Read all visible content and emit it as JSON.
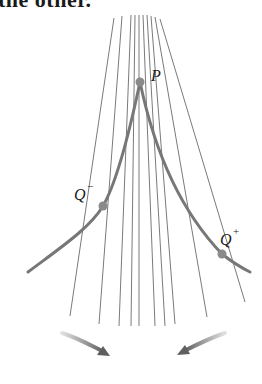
{
  "caption_fragment": "the other.",
  "points": {
    "P": {
      "label": "P",
      "x": 140,
      "y": 82
    },
    "Q_minus": {
      "label": "Q",
      "sup": "−",
      "x": 103,
      "y": 206
    },
    "Q_plus": {
      "label": "Q",
      "sup": "+",
      "x": 222,
      "y": 254
    }
  },
  "lines": [
    {
      "x1": 114,
      "y1": 18,
      "x2": 70,
      "y2": 316
    },
    {
      "x1": 122,
      "y1": 16,
      "x2": 99,
      "y2": 324
    },
    {
      "x1": 131,
      "y1": 15,
      "x2": 119,
      "y2": 326
    },
    {
      "x1": 135,
      "y1": 15,
      "x2": 131,
      "y2": 326
    },
    {
      "x1": 139,
      "y1": 15,
      "x2": 139,
      "y2": 326
    },
    {
      "x1": 143,
      "y1": 15,
      "x2": 155,
      "y2": 326
    },
    {
      "x1": 147,
      "y1": 15,
      "x2": 165,
      "y2": 326
    },
    {
      "x1": 151,
      "y1": 16,
      "x2": 175,
      "y2": 324
    },
    {
      "x1": 155,
      "y1": 17,
      "x2": 207,
      "y2": 317
    },
    {
      "x1": 160,
      "y1": 19,
      "x2": 245,
      "y2": 302
    }
  ],
  "colors": {
    "line": "#7a7a7a",
    "curve": "#777777",
    "dot": "#8a8a8a",
    "arrow_dark": "#6a6a6a",
    "arrow_light": "#dcdcdc"
  }
}
